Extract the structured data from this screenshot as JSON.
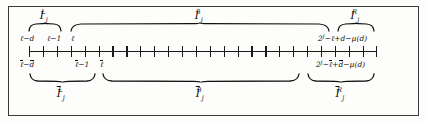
{
  "figure": {
    "background": "#fdfdfc",
    "ink": "#111111"
  },
  "top_row": {
    "braces": [
      {
        "name": "I_j^L",
        "label_base": "I",
        "label_sub": "j",
        "label_sup": "L",
        "x_start": 28,
        "x_end": 62,
        "center": 45
      },
      {
        "name": "I_j^0",
        "label_base": "I",
        "label_sub": "j",
        "label_sup": "0",
        "x_start": 70,
        "x_end": 330,
        "center": 200
      },
      {
        "name": "I_j^R",
        "label_base": "I",
        "label_sub": "j",
        "label_sup": "R",
        "x_start": 337,
        "x_end": 375,
        "center": 356
      }
    ],
    "endpoint_labels": [
      {
        "name": "ell-minus-d",
        "text": "ℓ−d",
        "x": 29
      },
      {
        "name": "ell-minus-one",
        "text": "ℓ−1",
        "x": 56
      },
      {
        "name": "ell",
        "text": "ℓ",
        "x": 74
      },
      {
        "name": "two-j-minus-ell-plus-d-minus-mu-d",
        "text": "2^j −ℓ+d−μ(d)",
        "x": 374
      }
    ]
  },
  "axis": {
    "name": "number-line",
    "x_start": 29,
    "x_end": 376,
    "y": 51,
    "tick_count": 26,
    "tick_spacing": 13.9
  },
  "bottom_row": {
    "endpoint_labels": [
      {
        "name": "ellbar-minus-dbar",
        "text": "ℓ−d",
        "x": 29
      },
      {
        "name": "ellbar-minus-one",
        "text": "ℓ−1",
        "x": 84
      },
      {
        "name": "ellbar",
        "text": "ℓ",
        "x": 104
      },
      {
        "name": "two-j-minus-ellbar-plus-dbar-minus-mu-d",
        "text": "2^j −ℓ+d−μ(d)",
        "x": 374
      }
    ],
    "braces": [
      {
        "name": "Ibar_j^L",
        "label_base": "I",
        "label_sub": "j",
        "label_sup": "L",
        "x_start": 29,
        "x_end": 96,
        "center": 62
      },
      {
        "name": "Ibar_j^0",
        "label_base": "I",
        "label_sub": "j",
        "label_sup": "0",
        "x_start": 102,
        "x_end": 300,
        "center": 201
      },
      {
        "name": "Ibar_j^R",
        "label_base": "I",
        "label_sub": "j",
        "label_sup": "R",
        "x_start": 307,
        "x_end": 375,
        "center": 341
      }
    ]
  },
  "glyphs": {
    "ell": "ℓ",
    "minus": "−",
    "mu": "μ",
    "two": "2",
    "j_exponent": "j",
    "d": "d",
    "one": "1",
    "paren_open": "(",
    "paren_close": ")"
  }
}
